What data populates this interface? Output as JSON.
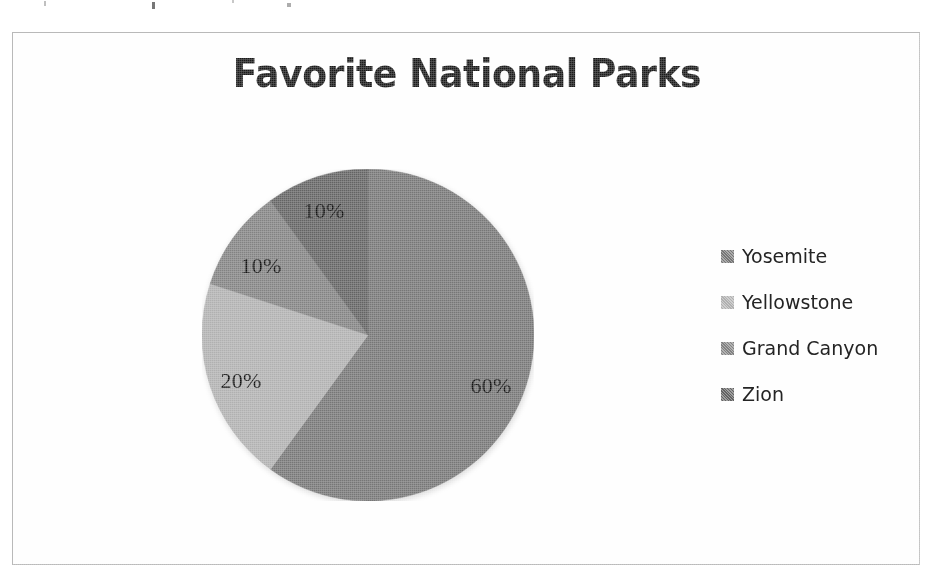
{
  "frame": {
    "border_color": "#b9b9b9",
    "background": "#fefefe"
  },
  "chart": {
    "title": "Favorite National Parks"
  },
  "legend": {
    "position": "right",
    "items": [
      {
        "label": "Yosemite",
        "color": "#767676",
        "swatch_name": "legend-swatch-yosemite"
      },
      {
        "label": "Yellowstone",
        "color": "#b0b0b0",
        "swatch_name": "legend-swatch-yellowstone"
      },
      {
        "label": "Grand Canyon",
        "color": "#828282",
        "swatch_name": "legend-swatch-grand-canyon"
      },
      {
        "label": "Zion",
        "color": "#636363",
        "swatch_name": "legend-swatch-zion"
      }
    ]
  },
  "labels": [
    {
      "text": "60%",
      "x": 478,
      "y": 353
    },
    {
      "text": "20%",
      "x": 228,
      "y": 348
    },
    {
      "text": "10%",
      "x": 248,
      "y": 233
    },
    {
      "text": "10%",
      "x": 311,
      "y": 178
    }
  ],
  "chart_data": {
    "type": "pie",
    "title": "Favorite National Parks",
    "xlabel": "",
    "ylabel": "",
    "unit": "percent",
    "legend_position": "right",
    "grid": false,
    "start_angle_deg": 90,
    "direction": "clockwise",
    "categories": [
      "Yosemite",
      "Yellowstone",
      "Grand Canyon",
      "Zion"
    ],
    "values": [
      60,
      20,
      10,
      10
    ],
    "value_labels": [
      "60%",
      "20%",
      "10%",
      "10%"
    ],
    "colors": [
      "#767676",
      "#b0b0b0",
      "#828282",
      "#636363"
    ],
    "slices": [
      {
        "name": "Yosemite",
        "value": 60,
        "label": "60%",
        "color": "#767676",
        "start_deg": 0,
        "end_deg": 216
      },
      {
        "name": "Yellowstone",
        "value": 20,
        "label": "20%",
        "color": "#b0b0b0",
        "start_deg": 216,
        "end_deg": 288
      },
      {
        "name": "Grand Canyon",
        "value": 10,
        "label": "10%",
        "color": "#828282",
        "start_deg": 288,
        "end_deg": 324
      },
      {
        "name": "Zion",
        "value": 10,
        "label": "10%",
        "color": "#636363",
        "start_deg": 324,
        "end_deg": 360
      }
    ]
  }
}
